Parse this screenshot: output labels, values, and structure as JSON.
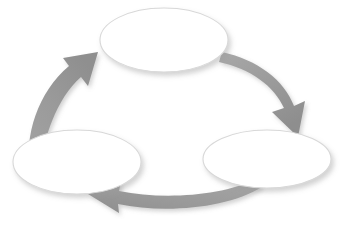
{
  "diagram": {
    "type": "cycle",
    "title": "",
    "background_color": "#ffffff",
    "direction": "clockwise",
    "stage_count": 3,
    "nodes": [
      {
        "id": "node-top",
        "label": "",
        "shape": "ellipse",
        "position": "top-center",
        "cx": 164,
        "cy": 40,
        "rx": 64,
        "ry": 32,
        "fill_color": "#ffffff",
        "stroke_color": "#d8d8d8"
      },
      {
        "id": "node-bottom-right",
        "label": "",
        "shape": "ellipse",
        "position": "bottom-right",
        "cx": 267,
        "cy": 159,
        "rx": 64,
        "ry": 29,
        "fill_color": "#ffffff",
        "stroke_color": "#d8d8d8"
      },
      {
        "id": "node-bottom-left",
        "label": "",
        "shape": "ellipse",
        "position": "bottom-left",
        "cx": 77,
        "cy": 162,
        "rx": 64,
        "ry": 32,
        "fill_color": "#ffffff",
        "stroke_color": "#d8d8d8"
      }
    ],
    "arrows": [
      {
        "id": "arrow-top-to-bottom-right",
        "label": "",
        "from": "node-top",
        "to": "node-bottom-right",
        "direction": "down-right",
        "color": "#9a9a9a"
      },
      {
        "id": "arrow-bottom-right-to-bottom-left",
        "label": "",
        "from": "node-bottom-right",
        "to": "node-bottom-left",
        "direction": "left",
        "color": "#9a9a9a"
      },
      {
        "id": "arrow-bottom-left-to-top",
        "label": "",
        "from": "node-bottom-left",
        "to": "node-top",
        "direction": "up-right",
        "color": "#9a9a9a"
      }
    ]
  }
}
